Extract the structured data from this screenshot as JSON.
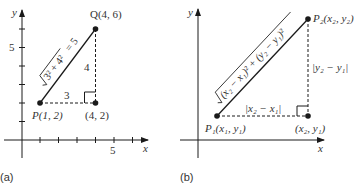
{
  "panels": [
    {
      "label": "(a)",
      "axis_x_label": "x",
      "axis_y_label": "y",
      "x_tick_label": "5",
      "y_tick_label": "5",
      "point_p": "P(1, 2)",
      "point_q": "Q(4, 6)",
      "corner": "(4, 2)",
      "horizontal_leg": "3",
      "vertical_leg": "4",
      "hypotenuse_formula": "√(3² + 4²) = 5",
      "hyp_radicand": "3² + 4²",
      "hyp_result": "= 5"
    },
    {
      "label": "(b)",
      "axis_x_label": "x",
      "axis_y_label": "y",
      "point_p1": "P₁(x₁, y₁)",
      "point_p2": "P₂(x₂, y₂)",
      "corner": "(x₂, y₁)",
      "horizontal_leg": "|x₂ − x₁|",
      "vertical_leg": "|y₂ − y₁|",
      "hypotenuse_formula": "√((x₂ − x₁)² + (y₂ − y₁)²)",
      "hyp_radicand": "(x₂ − x₁)² + (y₂ − y₁)²"
    }
  ],
  "colors": {
    "ink": "#1a1a1a",
    "background": "#ffffff"
  }
}
